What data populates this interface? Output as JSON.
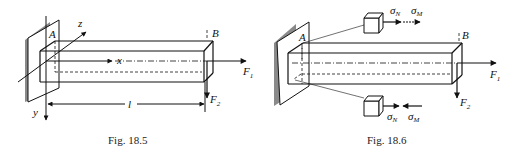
{
  "figures": [
    {
      "id": "fig-18-5",
      "caption": "Fig. 18.5",
      "labels": {
        "point_a": "A",
        "point_b": "B",
        "axis_x": "x",
        "axis_y": "y",
        "axis_z": "z",
        "length": "l",
        "force_1": "F",
        "force_1_sub": "1",
        "force_2": "F",
        "force_2_sub": "2"
      }
    },
    {
      "id": "fig-18-6",
      "caption": "Fig. 18.6",
      "labels": {
        "point_a": "A",
        "point_b": "B",
        "force_1": "F",
        "force_1_sub": "1",
        "force_2": "F",
        "force_2_sub": "2",
        "top_sigma_n": "σ",
        "top_sigma_n_sub": "N",
        "top_sigma_m": "σ",
        "top_sigma_m_sub": "M",
        "bottom_sigma_n": "σ",
        "bottom_sigma_n_sub": "N",
        "bottom_sigma_m": "σ",
        "bottom_sigma_m_sub": "M"
      }
    }
  ],
  "colors": {
    "line": "#111111",
    "wall": "#8a8a8a",
    "background": "#ffffff"
  }
}
